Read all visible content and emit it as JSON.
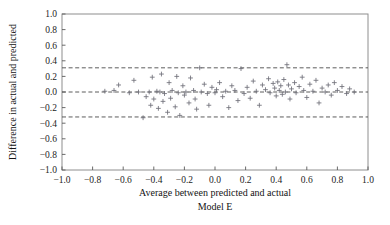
{
  "figure": {
    "caption": "Model E",
    "marker_symbol": "plus"
  },
  "chart_data": {
    "type": "scatter",
    "title": "",
    "subtitle": "Model E",
    "xlabel": "Average between predicted and actual",
    "ylabel": "Difference in actual and predicted",
    "xlim": [
      -1.0,
      1.0
    ],
    "ylim": [
      -1.0,
      1.0
    ],
    "grid": false,
    "legend": "none",
    "xticks": [
      -1.0,
      -0.8,
      -0.6,
      -0.4,
      -0.2,
      0.0,
      0.2,
      0.4,
      0.6,
      0.8,
      1.0
    ],
    "xtick_labels": [
      "-1.0",
      "-0.8",
      "-0.6",
      "-0.4",
      "-0.2",
      "0.0",
      "0.2",
      "0.4",
      "0.6",
      "0.8",
      "1.0"
    ],
    "yticks": [
      -1.0,
      -0.8,
      -0.6,
      -0.4,
      -0.2,
      0.0,
      0.2,
      0.4,
      0.6,
      0.8,
      1.0
    ],
    "ytick_labels": [
      "-1.0",
      "-0.8",
      "-0.6",
      "-0.4",
      "-0.2",
      "0.0",
      "0.2",
      "0.4",
      "0.6",
      "0.8",
      "1.0"
    ],
    "reference_lines": [
      {
        "name": "upper-limit-of-agreement",
        "y": 0.31,
        "style": "dashed"
      },
      {
        "name": "mean-bias",
        "y": 0.0,
        "style": "dashed"
      },
      {
        "name": "lower-limit-of-agreement",
        "y": -0.32,
        "style": "dashed"
      }
    ],
    "annotations": [],
    "series": [
      {
        "name": "bland-altman-points",
        "marker": "+",
        "color": "#6f6f78",
        "points": [
          [
            -0.72,
            0.01
          ],
          [
            -0.66,
            0.02
          ],
          [
            -0.63,
            0.09
          ],
          [
            -0.56,
            -0.01
          ],
          [
            -0.53,
            0.15
          ],
          [
            -0.5,
            0.0
          ],
          [
            -0.47,
            -0.33
          ],
          [
            -0.45,
            -0.06
          ],
          [
            -0.43,
            0.0
          ],
          [
            -0.42,
            -0.17
          ],
          [
            -0.41,
            0.19
          ],
          [
            -0.4,
            -0.09
          ],
          [
            -0.38,
            0.01
          ],
          [
            -0.37,
            -0.21
          ],
          [
            -0.36,
            0.0
          ],
          [
            -0.35,
            0.23
          ],
          [
            -0.34,
            -0.12
          ],
          [
            -0.33,
            -0.02
          ],
          [
            -0.31,
            -0.26
          ],
          [
            -0.3,
            0.12
          ],
          [
            -0.29,
            -0.08
          ],
          [
            -0.28,
            0.02
          ],
          [
            -0.26,
            -0.19
          ],
          [
            -0.25,
            0.2
          ],
          [
            -0.24,
            -0.01
          ],
          [
            -0.23,
            -0.3
          ],
          [
            -0.21,
            0.08
          ],
          [
            -0.2,
            -0.04
          ],
          [
            -0.19,
            0.0
          ],
          [
            -0.17,
            -0.14
          ],
          [
            -0.16,
            0.18
          ],
          [
            -0.14,
            0.02
          ],
          [
            -0.13,
            -0.09
          ],
          [
            -0.12,
            -0.22
          ],
          [
            -0.1,
            0.31
          ],
          [
            -0.09,
            0.0
          ],
          [
            -0.07,
            0.1
          ],
          [
            -0.05,
            -0.02
          ],
          [
            -0.04,
            -0.17
          ],
          [
            -0.02,
            0.06
          ],
          [
            0.0,
            -0.01
          ],
          [
            0.01,
            0.03
          ],
          [
            0.03,
            0.12
          ],
          [
            0.05,
            -0.06
          ],
          [
            0.07,
            0.01
          ],
          [
            0.09,
            -0.2
          ],
          [
            0.11,
            0.08
          ],
          [
            0.13,
            0.02
          ],
          [
            0.15,
            -0.11
          ],
          [
            0.17,
            0.3
          ],
          [
            0.19,
            -0.02
          ],
          [
            0.21,
            0.06
          ],
          [
            0.23,
            -0.08
          ],
          [
            0.25,
            0.14
          ],
          [
            0.27,
            0.01
          ],
          [
            0.29,
            -0.17
          ],
          [
            0.31,
            0.09
          ],
          [
            0.33,
            0.03
          ],
          [
            0.35,
            0.17
          ],
          [
            0.36,
            -0.01
          ],
          [
            0.38,
            0.11
          ],
          [
            0.39,
            0.05
          ],
          [
            0.4,
            -0.05
          ],
          [
            0.41,
            0.13
          ],
          [
            0.42,
            0.02
          ],
          [
            0.43,
            0.08
          ],
          [
            0.44,
            -0.03
          ],
          [
            0.45,
            0.16
          ],
          [
            0.46,
            0.0
          ],
          [
            0.47,
            0.35
          ],
          [
            0.48,
            0.09
          ],
          [
            0.49,
            -0.09
          ],
          [
            0.5,
            0.04
          ],
          [
            0.52,
            0.12
          ],
          [
            0.53,
            -0.01
          ],
          [
            0.55,
            0.07
          ],
          [
            0.57,
            0.19
          ],
          [
            0.58,
            0.02
          ],
          [
            0.6,
            -0.07
          ],
          [
            0.62,
            0.1
          ],
          [
            0.64,
            0.01
          ],
          [
            0.66,
            0.15
          ],
          [
            0.68,
            -0.14
          ],
          [
            0.7,
            0.05
          ],
          [
            0.72,
            0.0
          ],
          [
            0.74,
            0.09
          ],
          [
            0.76,
            -0.04
          ],
          [
            0.78,
            0.12
          ],
          [
            0.8,
            0.02
          ],
          [
            0.83,
            0.07
          ],
          [
            0.86,
            -0.02
          ],
          [
            0.88,
            0.04
          ],
          [
            0.91,
            0.0
          ]
        ]
      }
    ]
  }
}
